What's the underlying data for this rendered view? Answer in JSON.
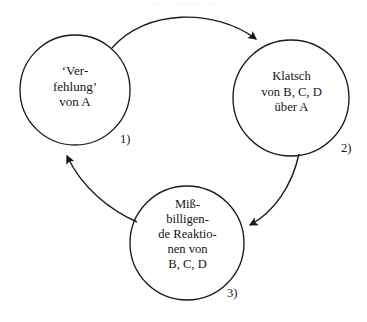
{
  "page": {
    "header_remnant": "......  ... ............ ........",
    "background_color": "#ffffff",
    "stroke_color": "#1a1a1a",
    "text_color": "#151515"
  },
  "diagram": {
    "type": "cycle-diagram",
    "title": "",
    "nodes": [
      {
        "id": "node-1",
        "number": "1)",
        "lines": [
          "‘Ver-",
          "fehlung’",
          "von  A"
        ],
        "text": "‘Ver-\nfehlung’\nvon  A",
        "cx": 75,
        "cy": 90,
        "r": 55
      },
      {
        "id": "node-2",
        "number": "2)",
        "lines": [
          "Klatsch",
          "von B, C, D",
          "über  A"
        ],
        "text": "Klatsch\nvon B, C, D\nüber  A",
        "cx": 291,
        "cy": 98,
        "r": 58
      },
      {
        "id": "node-3",
        "number": "3)",
        "lines": [
          "Miß-",
          "billigen-",
          "de Reaktio-",
          "nen von",
          "B, C, D"
        ],
        "text": "Miß-\nbilligen-\nde Reaktio-\nnen von\nB, C, D",
        "cx": 187,
        "cy": 243,
        "r": 57
      }
    ],
    "edges": [
      {
        "id": "edge-1-2",
        "from": "node-1",
        "to": "node-2",
        "direction": "clockwise"
      },
      {
        "id": "edge-2-3",
        "from": "node-2",
        "to": "node-3",
        "direction": "clockwise"
      },
      {
        "id": "edge-3-1",
        "from": "node-3",
        "to": "node-1",
        "direction": "clockwise"
      }
    ]
  }
}
